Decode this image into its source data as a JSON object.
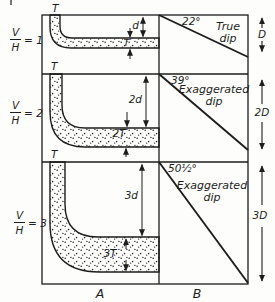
{
  "colors": {
    "ink": "#1d1d1d",
    "paper": "#fdfdfb"
  },
  "columns": {
    "left_label": "A",
    "right_label": "B"
  },
  "rows": [
    {
      "ratio": {
        "num": "V",
        "den": "H",
        "eq": "= 1"
      },
      "top_bed_label": "T",
      "depth_dim": "d",
      "thickness_dim": "T",
      "angle": "22°",
      "dip_label": {
        "line1": "True",
        "line2": "dip"
      },
      "right_depth": "D"
    },
    {
      "ratio": {
        "num": "V",
        "den": "H",
        "eq": "= 2"
      },
      "top_bed_label": "T",
      "depth_dim": "2d",
      "thickness_dim": "2T",
      "angle": "39°",
      "dip_label": {
        "line1": "Exaggerated",
        "line2": "dip"
      },
      "right_depth": "2D"
    },
    {
      "ratio": {
        "num": "V",
        "den": "H",
        "eq": "= 3"
      },
      "top_bed_label": "T",
      "depth_dim": "3d",
      "thickness_dim": "3T",
      "angle": "50½°",
      "dip_label": {
        "line1": "Exaggerated",
        "line2": "dip"
      },
      "right_depth": "3D"
    }
  ]
}
